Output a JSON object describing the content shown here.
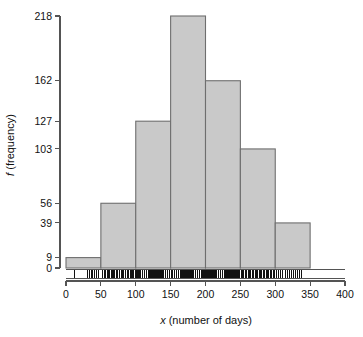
{
  "chart_data": {
    "type": "bar",
    "title": "",
    "subtitle": "",
    "xlabel_prefix": "x",
    "xlabel_rest": " (number of days)",
    "ylabel_prefix": "f",
    "ylabel_rest": " (frequency)",
    "xlabel": "x (number of days)",
    "ylabel": "f (frequency)",
    "bin_width": 50,
    "bin_edges": [
      0,
      50,
      100,
      150,
      200,
      250,
      300,
      350
    ],
    "categories": [
      "0-50",
      "50-100",
      "100-150",
      "150-200",
      "200-250",
      "250-300",
      "300-350"
    ],
    "values": [
      9,
      56,
      127,
      218,
      162,
      103,
      39
    ],
    "xlim": [
      0,
      400
    ],
    "ylim": [
      0,
      218
    ],
    "xticks": [
      0,
      50,
      100,
      150,
      200,
      250,
      300,
      350,
      400
    ],
    "xticklabels": [
      "0",
      "50",
      "100",
      "150",
      "200",
      "250",
      "300",
      "350",
      "400"
    ],
    "yticks": [
      0,
      9,
      39,
      56,
      103,
      127,
      162,
      218
    ],
    "yticklabels": [
      "0",
      "9",
      "39",
      "56",
      "103",
      "127",
      "162",
      "218"
    ],
    "grid": false,
    "legend": false,
    "bar_fill_color": "#c9c9c9",
    "bar_edge_color": "#6e6e6e",
    "axis_color": "#545454",
    "rug_color": "#111111",
    "rug_plot": true,
    "rug_values": [
      12,
      31,
      33,
      36,
      38,
      41,
      44,
      47,
      52,
      55,
      57,
      59,
      61,
      63,
      65,
      66,
      68,
      70,
      72,
      74,
      76,
      77,
      79,
      81,
      83,
      85,
      86,
      88,
      90,
      92,
      94,
      95,
      97,
      99,
      100,
      101,
      103,
      104,
      106,
      107,
      109,
      110,
      112,
      113,
      115,
      116,
      118,
      119,
      121,
      122,
      124,
      125,
      127,
      128,
      130,
      131,
      133,
      134,
      136,
      137,
      139,
      140,
      142,
      143,
      145,
      146,
      148,
      149,
      151,
      152,
      153,
      155,
      156,
      158,
      159,
      161,
      162,
      164,
      165,
      167,
      168,
      170,
      171,
      173,
      174,
      176,
      177,
      179,
      180,
      182,
      183,
      185,
      186,
      188,
      189,
      191,
      192,
      194,
      195,
      197,
      198,
      200,
      201,
      203,
      204,
      206,
      207,
      209,
      210,
      212,
      213,
      215,
      216,
      218,
      219,
      221,
      222,
      224,
      225,
      227,
      228,
      230,
      231,
      233,
      234,
      236,
      237,
      239,
      240,
      242,
      243,
      245,
      246,
      248,
      249,
      251,
      253,
      255,
      257,
      259,
      261,
      263,
      265,
      267,
      269,
      271,
      273,
      275,
      277,
      279,
      281,
      283,
      285,
      287,
      289,
      291,
      293,
      295,
      297,
      299,
      302,
      305,
      308,
      311,
      314,
      317,
      320,
      323,
      326,
      329,
      332,
      335,
      338
    ]
  }
}
